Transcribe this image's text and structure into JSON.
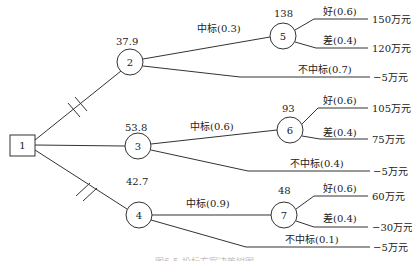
{
  "diagram": {
    "type": "decision-tree",
    "decision_node": {
      "id": "1",
      "label": "1"
    },
    "chance_nodes": [
      {
        "id": "2",
        "label": "2",
        "expected_value": "37.9"
      },
      {
        "id": "3",
        "label": "3",
        "expected_value": "53.8"
      },
      {
        "id": "4",
        "label": "4",
        "expected_value": "42.7"
      },
      {
        "id": "5",
        "label": "5",
        "expected_value": "138"
      },
      {
        "id": "6",
        "label": "6",
        "expected_value": "93"
      },
      {
        "id": "7",
        "label": "7",
        "expected_value": "48"
      }
    ],
    "branches": {
      "n2_win": "中标(0.3)",
      "n2_lose": "不中标(0.7)",
      "n3_win": "中标(0.6)",
      "n3_lose": "不中标(0.4)",
      "n4_win": "中标(0.9)",
      "n4_lose": "不中标(0.1)",
      "n5_good": "好(0.6)",
      "n5_bad": "差(0.4)",
      "n6_good": "好(0.6)",
      "n6_bad": "差(0.4)",
      "n7_good": "好(0.6)",
      "n7_bad": "差(0.4)"
    },
    "outcomes": {
      "n5_good": "150万元",
      "n5_bad": "120万元",
      "n2_lose": "−5万元",
      "n6_good": "105万元",
      "n6_bad": "75万元",
      "n3_lose": "−5万元",
      "n7_good": "60万元",
      "n7_bad": "−30万元",
      "n4_lose": "−5万元"
    },
    "pruned_branches": [
      "1-2",
      "1-4"
    ],
    "caption": "图6-5  投标方案决策树图"
  }
}
